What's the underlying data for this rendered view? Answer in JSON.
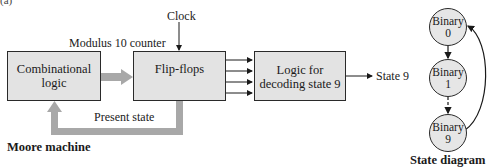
{
  "figure_number": "(a)",
  "moore_machine": {
    "caption": "Moore machine",
    "clock_label": "Clock",
    "counter_label": "Modulus 10 counter",
    "feedback_label": "Present state",
    "output_label": "State 9",
    "blocks": {
      "combinational": {
        "line1": "Combinational",
        "line2": "logic"
      },
      "flipflops": {
        "line1": "Flip-flops"
      },
      "decoder": {
        "line1": "Logic for",
        "line2": "decoding state 9"
      }
    },
    "flipflop_output_lines": 4
  },
  "state_diagram": {
    "caption": "State diagram",
    "states": [
      {
        "line1": "Binary",
        "line2": "0"
      },
      {
        "line1": "Binary",
        "line2": "1"
      },
      {
        "line1": "Binary",
        "line2": "9"
      }
    ]
  },
  "colors": {
    "block_fill": "#e3e3e3",
    "arrow_gray": "#a8a8a8",
    "stroke": "#2a2a2a"
  }
}
